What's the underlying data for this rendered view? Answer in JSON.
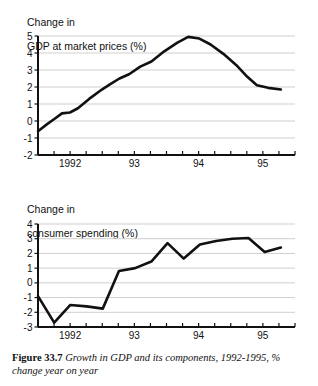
{
  "figure": {
    "caption_label": "Figure 33.7",
    "caption_text": "Growth in GDP and its components, 1992-1995, % change year on year"
  },
  "charts": [
    {
      "name": "gdp-chart",
      "title_line1": "Change in",
      "title_line2": "GDP at market prices (%)",
      "ylabels": [
        "5",
        "4",
        "3",
        "2",
        "1",
        "0",
        "-1",
        "-2"
      ],
      "xlabels": [
        "1992",
        "93",
        "94",
        "95"
      ]
    },
    {
      "name": "consumer-spending-chart",
      "title_line1": "Change in",
      "title_line2": "consumer spending (%)",
      "ylabels": [
        "4",
        "3",
        "2",
        "1",
        "0",
        "-1",
        "-2",
        "-3"
      ],
      "xlabels": [
        "1992",
        "93",
        "94",
        "95"
      ]
    }
  ],
  "chart_data": [
    {
      "type": "line",
      "name": "gdp-at-market-prices",
      "title": "Change in GDP at market prices (%)",
      "xlabel": "",
      "ylabel": "Change in GDP at market prices (%)",
      "ylim": [
        -2,
        5
      ],
      "yticks": [
        -2,
        -1,
        0,
        1,
        2,
        3,
        4,
        5
      ],
      "grid": true,
      "legend": "none",
      "x": [
        "1991Q4",
        "1992Q1",
        "1992Q2",
        "1992Q3",
        "1992Q4",
        "1993Q1",
        "1993Q2",
        "1993Q3",
        "1993Q4",
        "1994Q1",
        "1994Q2",
        "1994Q3",
        "1994Q4",
        "1995Q1",
        "1995Q2",
        "1995Q3",
        "1995Q4"
      ],
      "xtick_labels": [
        "1992",
        "93",
        "94",
        "95"
      ],
      "values": [
        -0.6,
        -0.1,
        0.45,
        0.5,
        0.8,
        1.4,
        2.0,
        2.3,
        2.75,
        3.3,
        3.9,
        4.6,
        4.95,
        4.6,
        3.9,
        3.0,
        2.1,
        1.8
      ],
      "series": [
        {
          "name": "GDP at market prices",
          "points": [
            {
              "x": 0.0,
              "y": -0.6
            },
            {
              "x": 0.55,
              "y": -0.2
            },
            {
              "x": 1.0,
              "y": 0.1
            },
            {
              "x": 1.5,
              "y": 0.45
            },
            {
              "x": 2.0,
              "y": 0.5
            },
            {
              "x": 2.5,
              "y": 0.75
            },
            {
              "x": 3.2,
              "y": 1.3
            },
            {
              "x": 4.0,
              "y": 1.85
            },
            {
              "x": 4.5,
              "y": 2.15
            },
            {
              "x": 5.1,
              "y": 2.5
            },
            {
              "x": 5.7,
              "y": 2.75
            },
            {
              "x": 6.4,
              "y": 3.2
            },
            {
              "x": 7.1,
              "y": 3.5
            },
            {
              "x": 7.9,
              "y": 4.1
            },
            {
              "x": 8.7,
              "y": 4.6
            },
            {
              "x": 9.4,
              "y": 4.95
            },
            {
              "x": 10.1,
              "y": 4.85
            },
            {
              "x": 10.8,
              "y": 4.5
            },
            {
              "x": 11.6,
              "y": 3.95
            },
            {
              "x": 12.4,
              "y": 3.3
            },
            {
              "x": 13.1,
              "y": 2.6
            },
            {
              "x": 13.7,
              "y": 2.1
            },
            {
              "x": 14.4,
              "y": 1.95
            },
            {
              "x": 15.2,
              "y": 1.85
            }
          ]
        }
      ]
    },
    {
      "type": "line",
      "name": "consumer-spending",
      "title": "Change in consumer spending (%)",
      "xlabel": "",
      "ylabel": "Change in consumer spending (%)",
      "ylim": [
        -3,
        4
      ],
      "yticks": [
        -3,
        -2,
        -1,
        0,
        1,
        2,
        3,
        4
      ],
      "grid": true,
      "legend": "none",
      "x": [
        "1991Q4",
        "1992Q1",
        "1992Q2",
        "1992Q3",
        "1992Q4",
        "1993Q1",
        "1993Q2",
        "1993Q3",
        "1993Q4",
        "1994Q1",
        "1994Q2",
        "1994Q3",
        "1994Q4",
        "1995Q1",
        "1995Q2",
        "1995Q3",
        "1995Q4"
      ],
      "xtick_labels": [
        "1992",
        "93",
        "94",
        "95"
      ],
      "values": [
        -0.9,
        -2.7,
        -1.5,
        -1.6,
        -1.75,
        0.8,
        1.0,
        1.45,
        2.7,
        1.65,
        2.6,
        2.85,
        3.0,
        3.05,
        2.1,
        2.4
      ],
      "series": [
        {
          "name": "Consumer spending",
          "points": [
            {
              "x": 0.0,
              "y": -0.9
            },
            {
              "x": 1.0,
              "y": -2.7
            },
            {
              "x": 2.0,
              "y": -1.5
            },
            {
              "x": 3.0,
              "y": -1.6
            },
            {
              "x": 4.0,
              "y": -1.75
            },
            {
              "x": 5.0,
              "y": 0.8
            },
            {
              "x": 6.0,
              "y": 1.0
            },
            {
              "x": 7.0,
              "y": 1.45
            },
            {
              "x": 8.0,
              "y": 2.7
            },
            {
              "x": 9.0,
              "y": 1.65
            },
            {
              "x": 10.0,
              "y": 2.6
            },
            {
              "x": 11.0,
              "y": 2.85
            },
            {
              "x": 12.0,
              "y": 3.0
            },
            {
              "x": 13.0,
              "y": 3.05
            },
            {
              "x": 14.0,
              "y": 2.1
            },
            {
              "x": 15.0,
              "y": 2.4
            }
          ]
        }
      ]
    }
  ],
  "style": {
    "line_color": "#111111",
    "grid_color": "#cfcfcf",
    "axis_color": "#111111",
    "background": "#ffffff"
  }
}
